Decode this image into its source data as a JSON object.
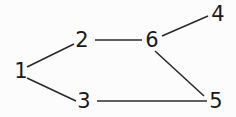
{
  "diagram": {
    "background_color": "#fcfcfc",
    "line_color": "#2b2b2b",
    "label_color": "#1a1a1a",
    "nodes": [
      {
        "id": "1",
        "label": "1",
        "x": 21,
        "y": 71
      },
      {
        "id": "2",
        "label": "2",
        "x": 82,
        "y": 40
      },
      {
        "id": "3",
        "label": "3",
        "x": 84,
        "y": 101
      },
      {
        "id": "4",
        "label": "4",
        "x": 218,
        "y": 14
      },
      {
        "id": "5",
        "label": "5",
        "x": 216,
        "y": 101
      },
      {
        "id": "6",
        "label": "6",
        "x": 152,
        "y": 40
      }
    ],
    "edges": [
      {
        "name": "edge-1-2",
        "from": "1",
        "to": "2",
        "x1": 27,
        "y1": 67,
        "x2": 74,
        "y2": 44
      },
      {
        "name": "edge-1-3",
        "from": "1",
        "to": "3",
        "x1": 27,
        "y1": 78,
        "x2": 76,
        "y2": 101
      },
      {
        "name": "edge-2-6",
        "from": "2",
        "to": "6",
        "x1": 95,
        "y1": 40,
        "x2": 142,
        "y2": 40
      },
      {
        "name": "edge-6-4",
        "from": "6",
        "to": "4",
        "x1": 162,
        "y1": 36,
        "x2": 208,
        "y2": 16
      },
      {
        "name": "edge-6-5",
        "from": "6",
        "to": "5",
        "x1": 155,
        "y1": 51,
        "x2": 204,
        "y2": 96
      },
      {
        "name": "edge-3-5",
        "from": "3",
        "to": "5",
        "x1": 97,
        "y1": 101,
        "x2": 207,
        "y2": 101
      }
    ]
  }
}
